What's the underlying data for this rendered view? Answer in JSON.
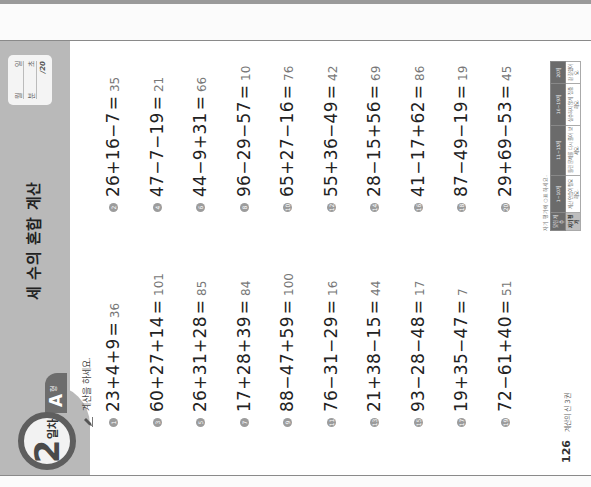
{
  "worksheet": {
    "day_badge": {
      "number": "2",
      "suffix": "일차"
    },
    "type_tab": {
      "letter": "A",
      "suffix": "형"
    },
    "title": "세 수의 혼합 계산",
    "score_box": {
      "month_label": "월",
      "day_label": "일",
      "minutes_label": "분",
      "seconds_label": "초",
      "total": "/20"
    },
    "instruction": "계산을 하세요.",
    "problems": [
      {
        "num": "1",
        "expr": "23+4+9",
        "answer": "36"
      },
      {
        "num": "2",
        "expr": "26+16−7",
        "answer": "35"
      },
      {
        "num": "3",
        "expr": "60+27+14",
        "answer": "101"
      },
      {
        "num": "4",
        "expr": "47−7−19",
        "answer": "21"
      },
      {
        "num": "5",
        "expr": "26+31+28",
        "answer": "85"
      },
      {
        "num": "6",
        "expr": "44−9+31",
        "answer": "66"
      },
      {
        "num": "7",
        "expr": "17+28+39",
        "answer": "84"
      },
      {
        "num": "8",
        "expr": "96−29−57",
        "answer": "10"
      },
      {
        "num": "9",
        "expr": "88−47+59",
        "answer": "100"
      },
      {
        "num": "10",
        "expr": "65+27−16",
        "answer": "76"
      },
      {
        "num": "11",
        "expr": "76−31−29",
        "answer": "16"
      },
      {
        "num": "12",
        "expr": "55+36−49",
        "answer": "42"
      },
      {
        "num": "13",
        "expr": "21+38−15",
        "answer": "44"
      },
      {
        "num": "14",
        "expr": "28−15+56",
        "answer": "69"
      },
      {
        "num": "15",
        "expr": "93−28−48",
        "answer": "17"
      },
      {
        "num": "16",
        "expr": "41−17+62",
        "answer": "86"
      },
      {
        "num": "17",
        "expr": "19+35−47",
        "answer": "7"
      },
      {
        "num": "18",
        "expr": "87−49−19",
        "answer": "19"
      },
      {
        "num": "19",
        "expr": "72−61+40",
        "answer": "51"
      },
      {
        "num": "20",
        "expr": "29+69−53",
        "answer": "45"
      }
    ],
    "equals_sign": "=",
    "footer": {
      "page_number": "126",
      "book_title": "계산의 신 3권"
    },
    "self_evaluation": {
      "caption": "자기 평가에 ○표 하세요.",
      "headers": [
        "맞힌 개수",
        "1~10개",
        "11~15개",
        "16~19개",
        "20개"
      ],
      "row": [
        "자기 평가",
        "계산 연습이 필요해요.",
        "틀린 문제를 다시 풀어 보세요.",
        "실수하지 않게 집중해요.",
        "참 잘했어요."
      ]
    }
  }
}
